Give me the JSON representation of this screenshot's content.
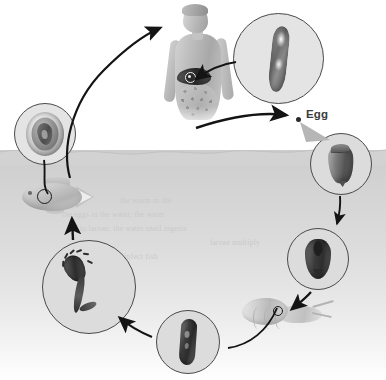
{
  "figure": {
    "kind": "biological-life-cycle-diagram",
    "palette": {
      "water": "#d4d4d4",
      "air": "#ffffff",
      "stroke": "#1d1d1d",
      "inset_fill": "#dcdcdc",
      "inset_border": "#4a4a4a",
      "label_text": "#3c3c3c"
    },
    "labels": [
      {
        "id": "egg",
        "text": "Egg"
      }
    ],
    "ghost_text": [
      "the worm in the",
      "the eggs in the water, the water",
      "to larvae; the water snail ingests",
      "larvae multiply",
      "leave the snail to infect fish"
    ]
  },
  "scene": {
    "water_label": "water body",
    "surface_label": "water surface"
  },
  "insets": [
    {
      "id": "adult-fluke",
      "name": "adult-fluke-inset",
      "stage": "Adult fluke",
      "x": 233,
      "y": 13,
      "d": 89
    },
    {
      "id": "metacercaria",
      "name": "metacercaria-inset",
      "stage": "Metacercaria cyst",
      "x": 14,
      "y": 103,
      "d": 60
    },
    {
      "id": "egg",
      "name": "egg-inset",
      "stage": "Egg",
      "x": 310,
      "y": 133,
      "d": 60
    },
    {
      "id": "redia",
      "name": "redia-inset",
      "stage": "Redia",
      "x": 287,
      "y": 228,
      "d": 60
    },
    {
      "id": "cercaria",
      "name": "cercaria-inset",
      "stage": "Cercaria",
      "x": 42,
      "y": 240,
      "d": 92
    },
    {
      "id": "miracidium",
      "name": "miracidium-inset",
      "stage": "Miracidium",
      "x": 156,
      "y": 310,
      "d": 62
    }
  ],
  "organisms": [
    {
      "id": "human",
      "name": "human-host",
      "role": "Definitive host (human)"
    },
    {
      "id": "fish",
      "name": "fish-host",
      "role": "Second intermediate host (fish)"
    },
    {
      "id": "snail",
      "name": "snail-host",
      "role": "First intermediate host (snail)"
    }
  ],
  "arrows": [
    {
      "id": "fish-to-human",
      "from": "fish",
      "to": "human",
      "style": "curved"
    },
    {
      "id": "human-to-egg",
      "from": "human",
      "to": "egg",
      "style": "curved"
    },
    {
      "id": "adult-to-human",
      "from": "adult-fluke",
      "to": "human-liver",
      "style": "curved"
    },
    {
      "id": "egg-to-water",
      "from": "egg-inset",
      "to": "water",
      "style": "straight"
    },
    {
      "id": "redia-to-snail",
      "from": "redia-inset",
      "to": "snail",
      "style": "straight"
    },
    {
      "id": "snail-to-miracidium",
      "from": "snail",
      "to": "miracidium",
      "style": "curved"
    },
    {
      "id": "miracidium-to-cercaria",
      "from": "miracidium",
      "to": "cercaria",
      "style": "straight"
    },
    {
      "id": "cercaria-to-fish",
      "from": "cercaria",
      "to": "fish",
      "style": "straight"
    },
    {
      "id": "metacercaria-to-fish",
      "from": "metacercaria",
      "to": "fish",
      "style": "curved"
    },
    {
      "id": "egg-callout",
      "from": "egg-label",
      "to": "egg-inset",
      "style": "wedge"
    }
  ]
}
